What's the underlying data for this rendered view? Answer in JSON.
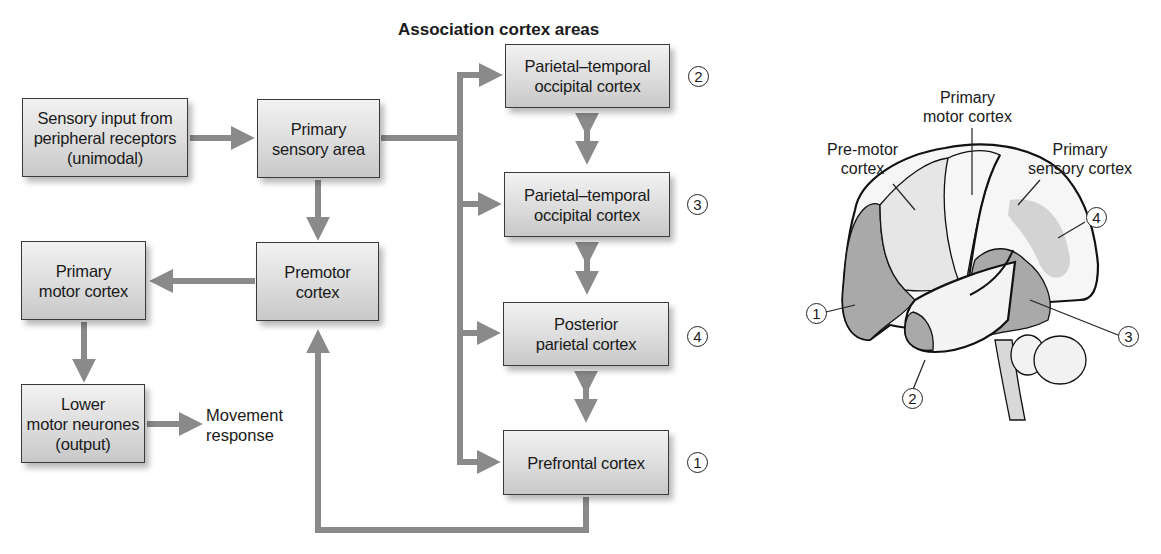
{
  "flowchart": {
    "title": "Association cortex areas",
    "boxes": {
      "sensory_input": "Sensory input from\nperipheral receptors\n(unimodal)",
      "primary_sensory": "Primary\nsensory area",
      "premotor": "Premotor\ncortex",
      "primary_motor": "Primary\nmotor cortex",
      "lower_motor": "Lower\nmotor neurones\n(output)",
      "pto_2": "Parietal–temporal\noccipital cortex",
      "pto_3": "Parietal–temporal\noccipital cortex",
      "posterior_parietal": "Posterior\nparietal cortex",
      "prefrontal": "Prefrontal cortex"
    },
    "output_label": "Movement\nresponse",
    "markers": {
      "pto_2": "2",
      "pto_3": "3",
      "posterior_parietal": "4",
      "prefrontal": "1"
    }
  },
  "brain": {
    "labels": {
      "primary_motor": "Primary\nmotor cortex",
      "premotor": "Pre-motor\ncortex",
      "primary_sensory": "Primary\nsensory cortex"
    },
    "markers": {
      "prefrontal": "1",
      "pto_2": "2",
      "pto_3": "3",
      "posterior_parietal": "4"
    },
    "colors": {
      "dark_region": "#a9a9a9",
      "light_region": "#e6e6e6",
      "pale_region": "#f6f6f6",
      "outline": "#111111"
    }
  },
  "colors": {
    "arrow": "#8a8a8a",
    "box_border": "#3a3a3a"
  }
}
